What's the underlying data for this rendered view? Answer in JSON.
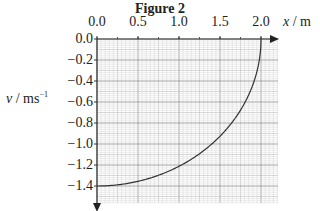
{
  "figure": {
    "title": "Figure 2",
    "xlabel_var": "x",
    "xlabel_unit": "m",
    "ylabel_var": "v",
    "ylabel_unit": "ms",
    "ylabel_unit_sup": "−1"
  },
  "x_ticks": [
    "0.0",
    "0.5",
    "1.0",
    "1.5",
    "2.0"
  ],
  "y_ticks": [
    "0.0",
    "−0.2",
    "−0.4",
    "−0.6",
    "−0.8",
    "−1.0",
    "−1.2",
    "−1.4"
  ],
  "chart_data": {
    "type": "line",
    "title": "Figure 2",
    "xlabel": "x / m",
    "ylabel": "v / ms^-1",
    "xlim": [
      0,
      2.2
    ],
    "ylim": [
      -1.5,
      0
    ],
    "x_ticks": [
      0.0,
      0.5,
      1.0,
      1.5,
      2.0
    ],
    "y_ticks": [
      0.0,
      -0.2,
      -0.4,
      -0.6,
      -0.8,
      -1.0,
      -1.2,
      -1.4
    ],
    "grid": true,
    "legend": null,
    "series": [
      {
        "name": "v vs x",
        "x": [
          0.0,
          0.25,
          0.5,
          0.75,
          1.0,
          1.25,
          1.5,
          1.75,
          1.9,
          2.0
        ],
        "y": [
          -1.4,
          -1.39,
          -1.36,
          -1.3,
          -1.21,
          -1.09,
          -0.93,
          -0.68,
          -0.44,
          0.0
        ]
      }
    ]
  }
}
